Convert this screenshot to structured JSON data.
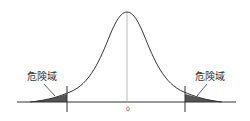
{
  "diagram": {
    "type": "normal-distribution",
    "center_label": "0",
    "left_region_label": "危険域",
    "right_region_label": "危険域",
    "colors": {
      "curve": "#333333",
      "shade": "#555555",
      "axis": "#333333",
      "center_line": "#999999"
    }
  }
}
